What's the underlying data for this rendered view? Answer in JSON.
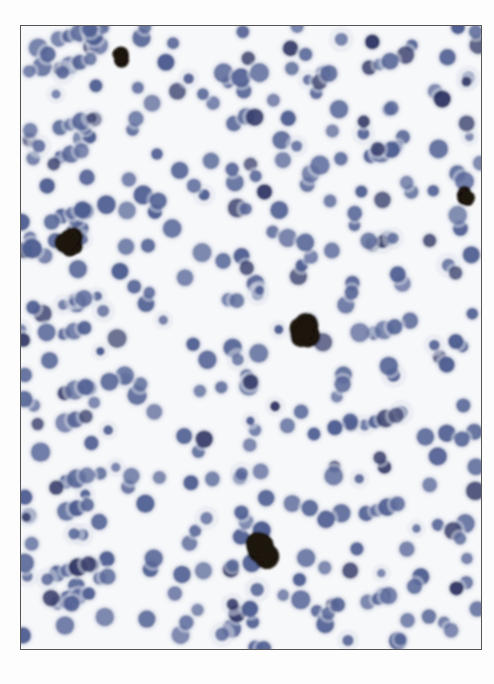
{
  "image": {
    "kind": "brightfield micrograph",
    "description": "Field of many round cells with blue-purple nuclei on pale background; several dark brown/black pigmented clusters",
    "colors": {
      "background": "#f7f8fa",
      "cytoplasm": "#dfe3ee",
      "nucleus": "#4a5a8f",
      "nucleus_dark": "#2a3060",
      "pigment": "#1a1208",
      "frame": "#555555"
    },
    "pigment_clusters": [
      {
        "x": 260,
        "y": 550,
        "r": 18
      },
      {
        "x": 305,
        "y": 330,
        "r": 17
      },
      {
        "x": 70,
        "y": 240,
        "r": 14
      },
      {
        "x": 120,
        "y": 55,
        "r": 10
      },
      {
        "x": 465,
        "y": 195,
        "r": 9
      }
    ]
  }
}
